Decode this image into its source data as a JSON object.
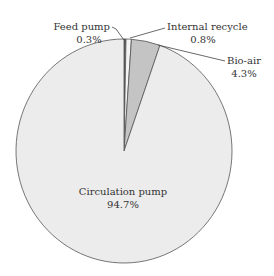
{
  "chart_data": {
    "type": "pie",
    "title": "",
    "start_angle_deg": 0,
    "direction": "clockwise",
    "slices": [
      {
        "name": "Feed pump",
        "value": 0.3,
        "label": "Feed pump",
        "pct_label": "0.3%",
        "color": "#5a5a5a"
      },
      {
        "name": "Internal recycle",
        "value": 0.8,
        "label": "Internal recycle",
        "pct_label": "0.8%",
        "color": "#f4f4f4"
      },
      {
        "name": "Bio-air",
        "value": 4.3,
        "label": "Bio-air",
        "pct_label": "4.3%",
        "color": "#c4c4c4"
      },
      {
        "name": "Circulation pump",
        "value": 94.7,
        "label": "Circulation pump",
        "pct_label": "94.7%",
        "color": "#ececec"
      }
    ],
    "legend": "none (callout labels)",
    "edge_color": "#555555"
  },
  "labels": {
    "feed_pump": {
      "name": "Feed pump",
      "pct": "0.3%"
    },
    "internal_recycle": {
      "name": "Internal recycle",
      "pct": "0.8%"
    },
    "bio_air": {
      "name": "Bio-air",
      "pct": "4.3%"
    },
    "circulation_pump": {
      "name": "Circulation pump",
      "pct": "94.7%"
    }
  }
}
